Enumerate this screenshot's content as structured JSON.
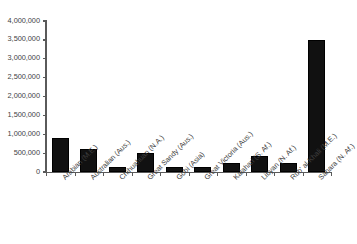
{
  "chart_data": {
    "type": "bar",
    "title": "",
    "subtitle": "",
    "xlabel": "",
    "ylabel": "",
    "categories": [
      "Arabian (M.E.)",
      "Australian (Aus.)",
      "Chihuahuan (N.A.)",
      "Great Sandy (Aus.)",
      "Gobi (Asia)",
      "Great Victoria (Aus.)",
      "Kalahari (S. Af.)",
      "Libyan (N. Af.)",
      "Rub' al-Khali (M.E.)",
      "Sahara (N. Af.)"
    ],
    "values": [
      900000,
      600000,
      140000,
      500000,
      130000,
      125000,
      230000,
      420000,
      250000,
      3500000
    ],
    "ylim": [
      0,
      4000000
    ],
    "ytick_values": [
      0,
      500000,
      1000000,
      1500000,
      2000000,
      2500000,
      3000000,
      3500000,
      4000000
    ],
    "ytick_labels": [
      "0",
      "500,000",
      "1,000,000",
      "1,500,000",
      "2,000,000",
      "2,500,000",
      "3,000,000",
      "3,500,000",
      "4,000,000"
    ],
    "grid": false,
    "legend": null,
    "legend_position": "none",
    "bar_color": "#111111",
    "axis_color": "#5a5a5a",
    "background_color": "#ffffff",
    "xlabel_rotation": -45
  }
}
